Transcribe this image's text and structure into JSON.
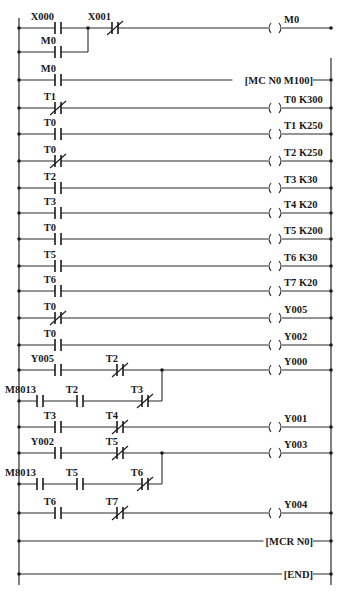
{
  "diagram": {
    "type": "plc-ladder-diagram",
    "left_rail_x": 19,
    "right_rail_x": 331,
    "rail_top": 18,
    "rail_bottom": 585,
    "coil_x": 275,
    "rungs": [
      {
        "id": "rung-m0-latch",
        "y": 28,
        "elements": [
          {
            "kind": "contact-no",
            "label": "X000",
            "x": 58
          },
          {
            "kind": "contact-nc",
            "label": "X001",
            "x": 115
          }
        ],
        "output": {
          "kind": "coil",
          "label": "M0"
        },
        "branch": {
          "y": 52,
          "join_x": 88,
          "elements": [
            {
              "kind": "contact-no",
              "label": "M0",
              "x": 58
            }
          ]
        }
      },
      {
        "id": "rung-mc",
        "y": 80,
        "elements": [
          {
            "kind": "contact-no",
            "label": "M0",
            "x": 58
          }
        ],
        "output": {
          "kind": "instruction",
          "label": "[MC  N0 M100]"
        }
      },
      {
        "id": "rung-t0",
        "y": 108,
        "elements": [
          {
            "kind": "contact-nc",
            "label": "T1",
            "x": 58
          }
        ],
        "output": {
          "kind": "coil",
          "label": "T0 K300"
        }
      },
      {
        "id": "rung-t1",
        "y": 134,
        "elements": [
          {
            "kind": "contact-no",
            "label": "T0",
            "x": 58
          }
        ],
        "output": {
          "kind": "coil",
          "label": "T1 K250"
        }
      },
      {
        "id": "rung-t2",
        "y": 161,
        "elements": [
          {
            "kind": "contact-nc",
            "label": "T0",
            "x": 58
          }
        ],
        "output": {
          "kind": "coil",
          "label": "T2 K250"
        }
      },
      {
        "id": "rung-t3",
        "y": 188,
        "elements": [
          {
            "kind": "contact-no",
            "label": "T2",
            "x": 58
          }
        ],
        "output": {
          "kind": "coil",
          "label": "T3 K30"
        }
      },
      {
        "id": "rung-t4",
        "y": 213,
        "elements": [
          {
            "kind": "contact-no",
            "label": "T3",
            "x": 58
          }
        ],
        "output": {
          "kind": "coil",
          "label": "T4 K20"
        }
      },
      {
        "id": "rung-t5",
        "y": 239,
        "elements": [
          {
            "kind": "contact-no",
            "label": "T0",
            "x": 58
          }
        ],
        "output": {
          "kind": "coil",
          "label": "T5 K200"
        }
      },
      {
        "id": "rung-t6",
        "y": 266,
        "elements": [
          {
            "kind": "contact-no",
            "label": "T5",
            "x": 58
          }
        ],
        "output": {
          "kind": "coil",
          "label": "T6 K30"
        }
      },
      {
        "id": "rung-t7",
        "y": 291,
        "elements": [
          {
            "kind": "contact-no",
            "label": "T6",
            "x": 58
          }
        ],
        "output": {
          "kind": "coil",
          "label": "T7 K20"
        }
      },
      {
        "id": "rung-y005",
        "y": 318,
        "elements": [
          {
            "kind": "contact-nc",
            "label": "T0",
            "x": 58
          }
        ],
        "output": {
          "kind": "coil",
          "label": "Y005"
        }
      },
      {
        "id": "rung-y002",
        "y": 345,
        "elements": [
          {
            "kind": "contact-no",
            "label": "T0",
            "x": 58
          }
        ],
        "output": {
          "kind": "coil",
          "label": "Y002"
        }
      },
      {
        "id": "rung-y000",
        "y": 370,
        "elements": [
          {
            "kind": "contact-no",
            "label": "Y005",
            "x": 58
          },
          {
            "kind": "contact-nc",
            "label": "T2",
            "x": 120
          }
        ],
        "output": {
          "kind": "coil",
          "label": "Y000"
        },
        "branch": {
          "y": 401,
          "join_x": 162,
          "elements": [
            {
              "kind": "contact-no",
              "label": "M8013",
              "x": 40
            },
            {
              "kind": "contact-no",
              "label": "T2",
              "x": 80
            },
            {
              "kind": "contact-nc",
              "label": "T3",
              "x": 145
            }
          ]
        }
      },
      {
        "id": "rung-y001",
        "y": 427,
        "elements": [
          {
            "kind": "contact-no",
            "label": "T3",
            "x": 58
          },
          {
            "kind": "contact-nc",
            "label": "T4",
            "x": 120
          }
        ],
        "output": {
          "kind": "coil",
          "label": "Y001"
        }
      },
      {
        "id": "rung-y003",
        "y": 453,
        "elements": [
          {
            "kind": "contact-no",
            "label": "Y002",
            "x": 58
          },
          {
            "kind": "contact-nc",
            "label": "T5",
            "x": 120
          }
        ],
        "output": {
          "kind": "coil",
          "label": "Y003"
        },
        "branch": {
          "y": 484,
          "join_x": 162,
          "elements": [
            {
              "kind": "contact-no",
              "label": "M8013",
              "x": 40
            },
            {
              "kind": "contact-no",
              "label": "T5",
              "x": 80
            },
            {
              "kind": "contact-nc",
              "label": "T6",
              "x": 145
            }
          ]
        }
      },
      {
        "id": "rung-y004",
        "y": 513,
        "elements": [
          {
            "kind": "contact-no",
            "label": "T6",
            "x": 58
          },
          {
            "kind": "contact-nc",
            "label": "T7",
            "x": 120
          }
        ],
        "output": {
          "kind": "coil",
          "label": "Y004"
        }
      },
      {
        "id": "rung-mcr",
        "y": 541,
        "elements": [],
        "output": {
          "kind": "instruction",
          "label": "[MCR N0]"
        }
      },
      {
        "id": "rung-end",
        "y": 574,
        "elements": [],
        "output": {
          "kind": "instruction",
          "label": "[END]"
        }
      }
    ]
  }
}
